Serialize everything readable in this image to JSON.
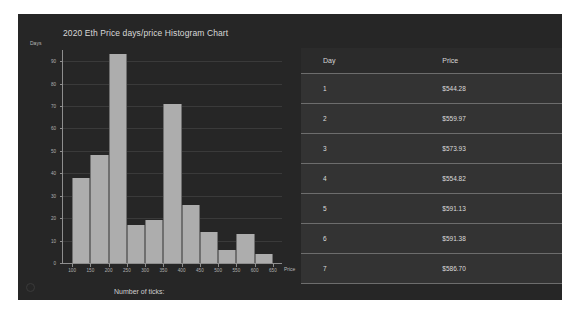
{
  "window": {
    "background_color": "#262626"
  },
  "chart_panel": {
    "ticks_control_label": "Number of ticks:"
  },
  "chart_data": {
    "type": "bar",
    "title": "2020 Eth Price days/price Histogram Chart",
    "xlabel": "Price",
    "ylabel": "Days",
    "xlim": [
      75,
      675
    ],
    "ylim": [
      0,
      95
    ],
    "grid": true,
    "legend": "none",
    "bar_color": "#adadad",
    "x_tick_labels": [
      "100",
      "150",
      "200",
      "250",
      "300",
      "350",
      "400",
      "450",
      "500",
      "550",
      "600",
      "650"
    ],
    "x_tick_values": [
      100,
      150,
      200,
      250,
      300,
      350,
      400,
      450,
      500,
      550,
      600,
      650
    ],
    "y_tick_labels": [
      "0",
      "10",
      "20",
      "30",
      "40",
      "50",
      "60",
      "70",
      "80",
      "90"
    ],
    "y_tick_values": [
      0,
      10,
      20,
      30,
      40,
      50,
      60,
      70,
      80,
      90
    ],
    "bin_edges": [
      100,
      150,
      200,
      250,
      300,
      350,
      400,
      450,
      500,
      550,
      600,
      650
    ],
    "categories": [
      "100-150",
      "150-200",
      "200-250",
      "250-300",
      "300-350",
      "350-400",
      "400-450",
      "450-500",
      "500-550",
      "550-600",
      "600-650"
    ],
    "values": [
      38,
      48,
      93,
      17,
      19,
      71,
      26,
      14,
      6,
      13,
      4
    ]
  },
  "table": {
    "columns": [
      "Day",
      "Price"
    ],
    "rows": [
      {
        "day": "1",
        "price": "$544.28"
      },
      {
        "day": "2",
        "price": "$559.97"
      },
      {
        "day": "3",
        "price": "$573.93"
      },
      {
        "day": "4",
        "price": "$554.82"
      },
      {
        "day": "5",
        "price": "$591.13"
      },
      {
        "day": "6",
        "price": "$591.38"
      },
      {
        "day": "7",
        "price": "$586.70"
      }
    ]
  }
}
